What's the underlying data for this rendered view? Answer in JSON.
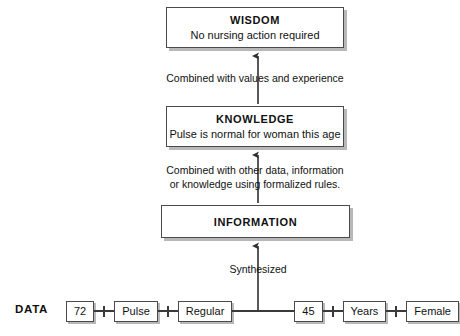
{
  "diagram": {
    "colors": {
      "box_border": "#4a4a4a",
      "box_shadow": "#b8b8b8",
      "line": "#3a3a3a",
      "text": "#111111",
      "background": "#ffffff"
    }
  },
  "levels": {
    "wisdom": {
      "title": "WISDOM",
      "subtitle": "No nursing action required"
    },
    "knowledge": {
      "title": "KNOWLEDGE",
      "subtitle": "Pulse is normal for woman this age"
    },
    "information": {
      "title": "INFORMATION",
      "subtitle": ""
    },
    "data": {
      "title": "DATA"
    }
  },
  "edges": {
    "knowledge_to_wisdom": "Combined with values and experience",
    "information_to_knowledge": "Combined with other data, information\nor knowledge using formalized rules.",
    "data_to_information": "Synthesized"
  },
  "data_elements": [
    {
      "label": "72"
    },
    {
      "label": "Pulse"
    },
    {
      "label": "Regular"
    },
    {
      "label": "45"
    },
    {
      "label": "Years"
    },
    {
      "label": "Female"
    }
  ],
  "icons": {
    "up_arrow": "arrow-up-icon",
    "link_tick": "link-tick-icon"
  }
}
